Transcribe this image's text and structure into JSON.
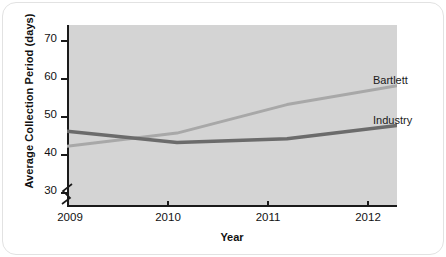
{
  "chart_data": {
    "type": "line",
    "title": "",
    "xlabel": "Year",
    "ylabel": "Average Collection Period (days)",
    "categories": [
      "2009",
      "2010",
      "2011",
      "2012"
    ],
    "x": [
      2009,
      2010,
      2011,
      2012
    ],
    "xlim": [
      2009,
      2012
    ],
    "ylim": [
      26,
      74
    ],
    "yticks": [
      30,
      40,
      50,
      60,
      70
    ],
    "ytick_labels": [
      "30",
      "40",
      "50",
      "60",
      "70"
    ],
    "xticks": [
      2009,
      2010,
      2011,
      2012
    ],
    "xtick_labels": [
      "2009",
      "2010",
      "2011",
      "2012"
    ],
    "grid": false,
    "legend_position": "line-end-labels",
    "axis_break": true,
    "plot_background": "#d4d4d4",
    "series": [
      {
        "name": "Bartlett",
        "color": "#a8a8a8",
        "values": [
          42,
          45.5,
          53,
          58
        ]
      },
      {
        "name": "Industry",
        "color": "#6b6b6b",
        "values": [
          46,
          43,
          44,
          47.5
        ]
      }
    ]
  },
  "axis": {
    "y_title": "Average Collection Period (days)",
    "x_title": "Year"
  }
}
